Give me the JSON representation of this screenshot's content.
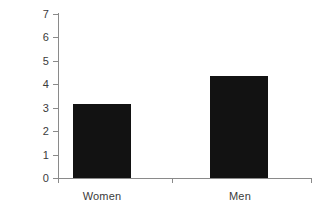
{
  "chart_data": {
    "type": "bar",
    "title": "",
    "subtitle": "",
    "xlabel": "",
    "ylabel": "",
    "categories": [
      "Women",
      "Men"
    ],
    "values": [
      3.15,
      4.35
    ],
    "ylim": [
      0,
      7
    ],
    "yticks": [
      0,
      1,
      2,
      3,
      4,
      5,
      6,
      7
    ],
    "ytick_labels": [
      "0",
      "1",
      "2",
      "3",
      "4",
      "5",
      "6",
      "7"
    ],
    "grid": false,
    "legend": null,
    "bar_color": "#121212",
    "axis_color": "#8a8a8a",
    "text_color": "#3b3b3b",
    "background": "#ffffff"
  },
  "axis": {
    "y": {
      "labels": [
        "7",
        "6",
        "5",
        "4",
        "3",
        "2",
        "1",
        "0"
      ]
    },
    "x": {
      "labels": [
        "Women",
        "Men"
      ]
    }
  }
}
